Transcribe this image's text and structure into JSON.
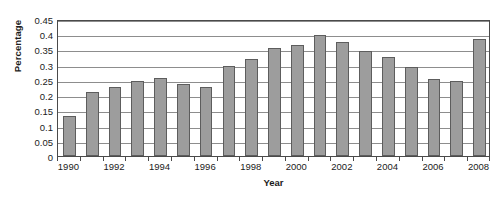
{
  "chart_data": {
    "type": "bar",
    "title": "",
    "xlabel": "Year",
    "ylabel": "Percentage",
    "categories": [
      "1990",
      "1991",
      "1992",
      "1993",
      "1994",
      "1995",
      "1996",
      "1997",
      "1998",
      "1999",
      "2000",
      "2001",
      "2002",
      "2003",
      "2004",
      "2005",
      "2006",
      "2007",
      "2008"
    ],
    "values": [
      0.13,
      0.21,
      0.228,
      0.248,
      0.257,
      0.238,
      0.227,
      0.297,
      0.318,
      0.356,
      0.366,
      0.396,
      0.375,
      0.345,
      0.324,
      0.294,
      0.253,
      0.245,
      0.383
    ],
    "series": [
      {
        "name": "Percentage",
        "values": [
          0.13,
          0.21,
          0.228,
          0.248,
          0.257,
          0.238,
          0.227,
          0.297,
          0.318,
          0.356,
          0.366,
          0.396,
          0.375,
          0.345,
          0.324,
          0.294,
          0.253,
          0.245,
          0.383
        ]
      }
    ],
    "ylim": [
      0,
      0.45
    ],
    "ytick_labels": [
      "0.45",
      "0.4",
      "0.35",
      "0.3",
      "0.25",
      "0.2",
      "0.15",
      "0.1",
      "0.05",
      "0"
    ],
    "ytick_values": [
      0.45,
      0.4,
      0.35,
      0.3,
      0.25,
      0.2,
      0.15,
      0.1,
      0.05,
      0
    ],
    "xtick_labels": [
      "1990",
      "1992",
      "1994",
      "1996",
      "1998",
      "2000",
      "2002",
      "2004",
      "2006",
      "2008"
    ],
    "xtick_categories": [
      "1990",
      "1992",
      "1994",
      "1996",
      "1998",
      "2000",
      "2002",
      "2004",
      "2006",
      "2008"
    ],
    "grid": "horizontal",
    "legend": "none",
    "legend_position": "none",
    "bar_color": "#9d9d9d",
    "bar_border_color": "#5d5d5d",
    "gridline_color": "#8d8d8d",
    "axis_color": "#4a4a4a",
    "text_color": "#1b1b1b",
    "background_color": "#ffffff"
  }
}
